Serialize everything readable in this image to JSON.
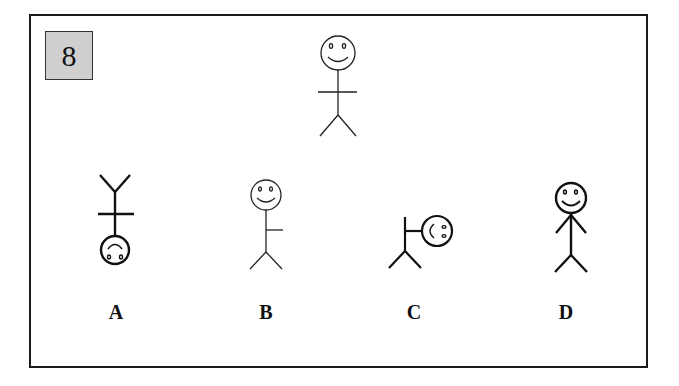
{
  "question": {
    "number": "8",
    "number_box_color": "#cfcfcf",
    "stimulus": {
      "description": "stick figure, upright, smiling face, arms horizontal",
      "orientation": "upright"
    },
    "options": [
      {
        "label": "A",
        "description": "stick figure rotated upside down (head at bottom), arms horizontal"
      },
      {
        "label": "B",
        "description": "upright stick figure with single arm extended to the right"
      },
      {
        "label": "C",
        "description": "stick figure rotated 90 degrees, head to the right"
      },
      {
        "label": "D",
        "description": "upright stick figure, bold lines, arms angled down"
      }
    ]
  }
}
